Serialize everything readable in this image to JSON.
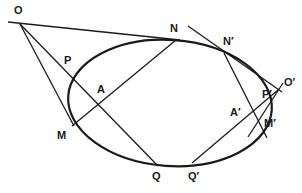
{
  "diagram": {
    "curve": "ellipse",
    "stroke_color": "#1a1a1a",
    "background": "#ffffff",
    "points": {
      "O": "O",
      "N": "N",
      "P": "P",
      "A": "A",
      "M": "M",
      "Q": "Q",
      "N_prime": "N′",
      "O_prime": "O′",
      "P_prime": "P′",
      "A_prime": "A′",
      "M_prime": "M′",
      "Q_prime": "Q′"
    },
    "lines": [
      {
        "name": "tangent-ON",
        "from": "O",
        "to": "N"
      },
      {
        "name": "tangent-OM",
        "from": "O",
        "to": "M"
      },
      {
        "name": "secant-OQ",
        "from": "O",
        "to": "Q",
        "through": [
          "P",
          "A"
        ]
      },
      {
        "name": "chord-MN",
        "from": "M",
        "to": "N",
        "through": [
          "A"
        ]
      },
      {
        "name": "tangent-O'N'",
        "from": "O′",
        "to": "N′"
      },
      {
        "name": "tangent-O'M'",
        "from": "O′",
        "to": "M′"
      },
      {
        "name": "secant-O'Q'",
        "from": "O′",
        "to": "Q′",
        "through": [
          "P′",
          "A′"
        ]
      },
      {
        "name": "chord-M'N'",
        "from": "M′",
        "to": "N′",
        "through": [
          "A′"
        ]
      }
    ]
  }
}
